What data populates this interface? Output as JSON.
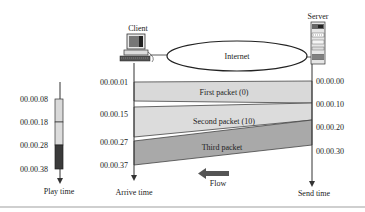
{
  "diagram": {
    "title": "",
    "nodes": {
      "client": {
        "label": "Client",
        "icon": "desktop-computer-icon"
      },
      "internet": {
        "label": "Internet",
        "shape": "ellipse"
      },
      "server": {
        "label": "Server",
        "icon": "server-rack-icon"
      }
    },
    "axes": {
      "play": {
        "label": "Play time",
        "ticks": [
          "00.00.08",
          "00.00.18",
          "00.00.28",
          "00.00.38"
        ]
      },
      "arrive": {
        "label": "Arrive time",
        "ticks": [
          "00.00.01",
          "00.00.15",
          "00.00.27",
          "00.00.37"
        ]
      },
      "send": {
        "label": "Send time",
        "ticks": [
          "00.00.00",
          "00.00.10",
          "00.00.20",
          "00.00.30"
        ]
      }
    },
    "packets": [
      {
        "label": "First packet (0)",
        "color": "#d9d9d9"
      },
      {
        "label": "Second packet (10)",
        "color": "#dcdcdc"
      },
      {
        "label": "Third packet",
        "color": "#a9a9a9"
      }
    ],
    "flow": {
      "label": "Flow",
      "color": "#555555"
    },
    "colors": {
      "line": "#333333",
      "light_fill": "#d8d8d8",
      "dark_fill": "#3a3a3a",
      "mid_fill": "#a8a8a8"
    }
  }
}
